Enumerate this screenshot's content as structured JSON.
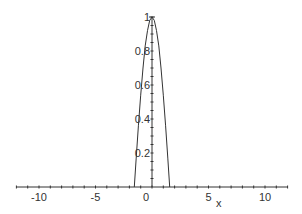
{
  "chart_data": {
    "type": "line",
    "title": "",
    "xlabel": "x",
    "ylabel": "",
    "xlim": [
      -12,
      12
    ],
    "ylim": [
      0,
      1
    ],
    "grid": false,
    "legend": null,
    "x_ticks": [
      -10,
      -5,
      0,
      5,
      10
    ],
    "x_tick_labels": [
      "-10",
      "-5",
      "0",
      "5",
      "10"
    ],
    "y_ticks": [
      0.2,
      0.4,
      0.6,
      0.8,
      1
    ],
    "y_tick_labels": [
      "0.2",
      "0.4",
      "0.6",
      "0.8",
      "1"
    ],
    "series": [
      {
        "name": "f(x)",
        "color": "#333333",
        "x": [
          -12,
          -1.57,
          -1.4,
          -1.2,
          -1.0,
          -0.8,
          -0.6,
          -0.4,
          -0.2,
          0,
          0.2,
          0.4,
          0.6,
          0.8,
          1.0,
          1.2,
          1.4,
          1.57,
          12
        ],
        "y": [
          0,
          0,
          0.17,
          0.36,
          0.54,
          0.7,
          0.83,
          0.92,
          0.98,
          1,
          0.98,
          0.92,
          0.83,
          0.7,
          0.54,
          0.36,
          0.17,
          0,
          0
        ]
      }
    ]
  },
  "colors": {
    "axis": "#333333",
    "curve": "#333333",
    "background": "#ffffff"
  }
}
